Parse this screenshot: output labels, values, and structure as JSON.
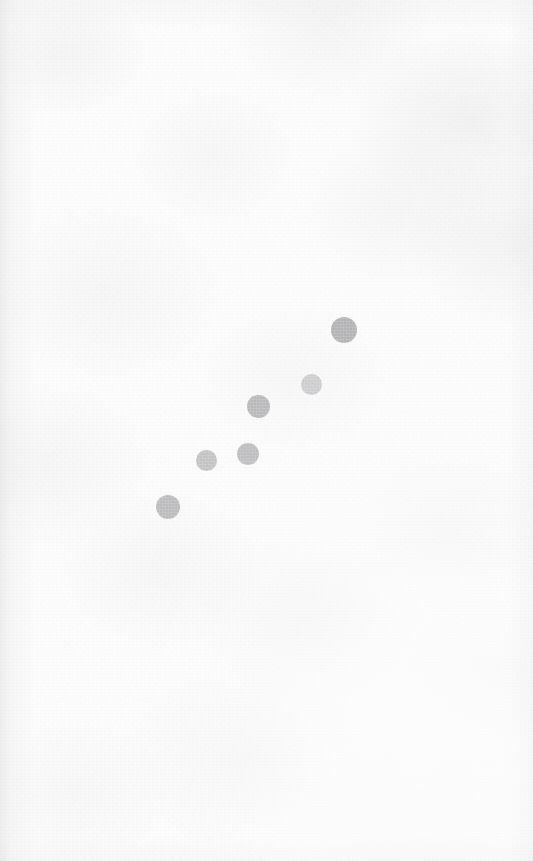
{
  "chart_data": {
    "type": "scatter",
    "title": "",
    "subtitle": "",
    "xlabel": "",
    "ylabel": "",
    "xlim": [
      0,
      533
    ],
    "ylim": [
      0,
      861
    ],
    "grid": false,
    "axes_visible": false,
    "legend": null,
    "annotations": [],
    "tick_labels": {
      "x": [],
      "y": []
    },
    "background": {
      "name": "paper-texture",
      "base_color": "#fcfcfc",
      "mottle_color": "#96969b",
      "edge_shadow_color": "#8e9096",
      "description": "off-white mottled paper with faint grain, slightly grey upper-right, darker narrow band along left edge"
    },
    "marker_shape": "circle",
    "marker_count": 6,
    "points": [
      {
        "id": "p1",
        "label": "point-1",
        "cx": 168,
        "cy": 507,
        "r": 12.0,
        "color": "#b5b5b7",
        "opacity": 0.88
      },
      {
        "id": "p2",
        "label": "point-2",
        "cx": 206,
        "cy": 460,
        "r": 10.5,
        "color": "#bcbcbe",
        "opacity": 0.86
      },
      {
        "id": "p3",
        "label": "point-3",
        "cx": 248,
        "cy": 454,
        "r": 11.0,
        "color": "#b8b8ba",
        "opacity": 0.88
      },
      {
        "id": "p4",
        "label": "point-4",
        "cx": 258,
        "cy": 406,
        "r": 11.5,
        "color": "#b4b4b6",
        "opacity": 0.9
      },
      {
        "id": "p5",
        "label": "point-5",
        "cx": 311,
        "cy": 384,
        "r": 10.5,
        "color": "#c6c6c8",
        "opacity": 0.82
      },
      {
        "id": "p6",
        "label": "point-6",
        "cx": 344,
        "cy": 330,
        "r": 13.0,
        "color": "#afafb1",
        "opacity": 0.92
      }
    ],
    "x": [
      168,
      206,
      248,
      258,
      311,
      344
    ],
    "y": [
      507,
      460,
      454,
      406,
      384,
      330
    ],
    "sizes": [
      12.0,
      10.5,
      11.0,
      11.5,
      10.5,
      13.0
    ],
    "trend": "increasing from lower-left to upper-right (in screen coords y decreases as x increases)"
  }
}
